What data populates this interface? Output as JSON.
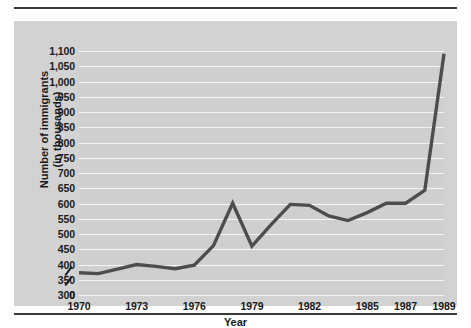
{
  "chart_data": {
    "type": "line",
    "title": "",
    "xlabel": "Year",
    "ylabel": "Number of immigrants\n(in thousands)",
    "ylabel_line1": "Number of immigrants",
    "ylabel_line2": "(in thousands)",
    "grid": true,
    "legend": "none",
    "axis_break": true,
    "axis_break_note": "y-axis broken between 0 and 300",
    "ylim": [
      300,
      1100
    ],
    "ytick_labels": [
      "1,100",
      "1,050",
      "1,000",
      "950",
      "900",
      "850",
      "800",
      "750",
      "700",
      "650",
      "600",
      "550",
      "500",
      "450",
      "400",
      "350",
      "300"
    ],
    "ytick_values": [
      1100,
      1050,
      1000,
      950,
      900,
      850,
      800,
      750,
      700,
      650,
      600,
      550,
      500,
      450,
      400,
      350,
      300
    ],
    "yzero_label": "0",
    "xtick_labels": [
      "1970",
      "1973",
      "1976",
      "1979",
      "1982",
      "1985",
      "1987",
      "1989"
    ],
    "xtick_values": [
      1970,
      1973,
      1976,
      1979,
      1982,
      1985,
      1987,
      1989
    ],
    "xlim": [
      1970,
      1989
    ],
    "x": [
      1970,
      1971,
      1972,
      1973,
      1974,
      1975,
      1976,
      1977,
      1978,
      1979,
      1980,
      1981,
      1982,
      1983,
      1984,
      1985,
      1986,
      1987,
      1988,
      1989
    ],
    "values": [
      373,
      370,
      385,
      400,
      394,
      386,
      398,
      462,
      601,
      460,
      531,
      597,
      594,
      559,
      544,
      570,
      601,
      601,
      643,
      1091
    ],
    "series": [
      {
        "name": "Number of immigrants (in thousands)",
        "color": "#4d4d4d",
        "values": [
          373,
          370,
          385,
          400,
          394,
          386,
          398,
          462,
          601,
          460,
          531,
          597,
          594,
          559,
          544,
          570,
          601,
          601,
          643,
          1091
        ]
      }
    ],
    "colors": {
      "line": "#4d4d4d",
      "plot_background": "#cfcfcf",
      "card_background": "#d2d2d2",
      "gridline": "#f4f4f4",
      "text": "#1a1a1a",
      "rule": "#3a3a3a"
    }
  }
}
